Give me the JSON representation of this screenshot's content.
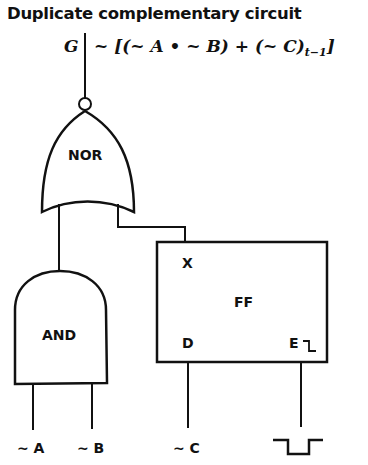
{
  "title": "Duplicate complementary circuit",
  "output": {
    "label": "G",
    "expression_main": "~ [(~ A • ~ B) + (~ C)",
    "expression_sub": "t−1",
    "expression_end": "]"
  },
  "gates": {
    "nor": {
      "label": "NOR"
    },
    "and": {
      "label": "AND"
    },
    "flipflop": {
      "label": "FF",
      "pins": {
        "x": "X",
        "d": "D",
        "e": "E"
      },
      "enable_edge_icon": "falling-edge"
    }
  },
  "inputs": {
    "a": "~ A",
    "b": "~ B",
    "c": "~ C",
    "clock_symbol": "negative-pulse"
  },
  "colors": {
    "line": "#111111",
    "background": "#ffffff"
  }
}
